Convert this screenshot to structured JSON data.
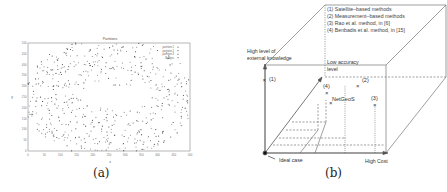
{
  "figure_a": {
    "caption": "(a)",
    "chart_data": {
      "type": "scatter",
      "title": "Partitions",
      "xlabel": "x",
      "ylabel": "y",
      "xlim": [
        0,
        500
      ],
      "ylim": [
        0,
        500
      ],
      "xticks": [
        "0",
        "50",
        "100",
        "150",
        "200",
        "250",
        "300",
        "350",
        "400",
        "450",
        "500"
      ],
      "yticks": [
        "0",
        "50",
        "100",
        "150",
        "200",
        "250",
        "300",
        "350",
        "400",
        "450",
        "500"
      ],
      "legend": [
        "partition 1",
        "partition 2",
        "partition 3",
        "Bridges"
      ],
      "legend_position": "upper right",
      "description": "Ring-shaped scatter of nodes around an empty central region (~x 230-330, y 200-300)"
    }
  },
  "figure_b": {
    "caption": "(b)",
    "legend": [
      "(1) Satellite–based methods",
      "(2) Measurement–based methods",
      "(3) Rao et al. method, in [6]",
      "(4) Benbadis et al. method, in [15]"
    ],
    "axes": {
      "vertical": "High level of",
      "vertical2": "external knowledge",
      "depth": "Low accuracy",
      "depth2": "level",
      "horizontal": "High Cost",
      "origin": "Ideal case"
    },
    "points": [
      {
        "label": "(1)"
      },
      {
        "label": "(2)"
      },
      {
        "label": "(3)"
      },
      {
        "label": "(4)"
      },
      {
        "label": "NetGeoS"
      }
    ]
  }
}
